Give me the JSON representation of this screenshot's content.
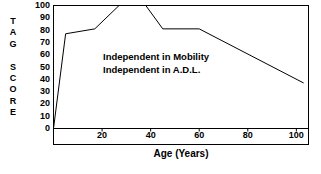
{
  "chart_data": {
    "type": "line",
    "title": "",
    "xlabel": "Age (Years)",
    "ylabel": "TAG SCORE",
    "ylabel_letters": [
      "T",
      "A",
      "G",
      "",
      "S",
      "C",
      "O",
      "R",
      "E"
    ],
    "xlim": [
      0,
      105
    ],
    "ylim": [
      0,
      100
    ],
    "grid": false,
    "legend": "none",
    "yticks": [
      100,
      90,
      80,
      70,
      60,
      50,
      40,
      30,
      20,
      10,
      0
    ],
    "xticks": [
      20,
      40,
      60,
      80,
      100
    ],
    "line_color": "#000000",
    "frame_color": "#000000",
    "series": [
      {
        "name": "TAG Score",
        "x": [
          0,
          5,
          17,
          27,
          38,
          45,
          60,
          103
        ],
        "y": [
          0,
          77,
          81,
          100,
          100,
          81,
          81,
          37
        ]
      }
    ],
    "annotations": [
      "Independent in Mobility",
      "Independent in A.D.L."
    ]
  }
}
